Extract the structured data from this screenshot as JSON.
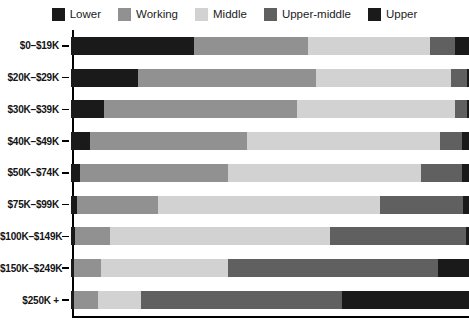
{
  "legend": {
    "position": "top",
    "items": [
      {
        "label": "Lower",
        "color": "#1a1a1a",
        "icon": "legend-swatch-icon"
      },
      {
        "label": "Working",
        "color": "#919191",
        "icon": "legend-swatch-icon"
      },
      {
        "label": "Middle",
        "color": "#d2d2d2",
        "icon": "legend-swatch-icon"
      },
      {
        "label": "Upper-middle",
        "color": "#606060",
        "icon": "legend-swatch-icon"
      },
      {
        "label": "Upper",
        "color": "#1a1a1a",
        "icon": "legend-swatch-icon"
      }
    ]
  },
  "axes": {
    "ylabel": "",
    "xlabel": "",
    "xlim": [
      0,
      100
    ],
    "grid": false,
    "ticks": "left"
  },
  "chart_data": {
    "type": "bar",
    "orientation": "horizontal",
    "stacked": true,
    "normalized": true,
    "title": "",
    "subtitle": "",
    "xlabel": "",
    "ylabel": "",
    "xlim": [
      0,
      100
    ],
    "grid": false,
    "legend_position": "top",
    "categories": [
      "$0–$19K",
      "$20K–$29K",
      "$30K–$39K",
      "$40K–$49K",
      "$50K–$74K",
      "$75K–$99K",
      "$100K–$149K",
      "$150K–$249K",
      "$250K +"
    ],
    "series": [
      {
        "name": "Lower",
        "color": "#1a1a1a",
        "values": [
          31.0,
          17.0,
          8.5,
          4.8,
          2.3,
          1.6,
          1.2,
          1.0,
          1.0
        ]
      },
      {
        "name": "Working",
        "color": "#919191",
        "values": [
          28.5,
          44.6,
          48.4,
          39.6,
          37.3,
          20.4,
          8.6,
          6.6,
          6.0
        ]
      },
      {
        "name": "Middle",
        "color": "#d2d2d2",
        "values": [
          30.7,
          34.0,
          39.6,
          48.4,
          48.4,
          55.7,
          55.4,
          32.0,
          10.8
        ]
      },
      {
        "name": "Upper-middle",
        "color": "#606060",
        "values": [
          6.3,
          3.8,
          3.0,
          5.5,
          10.3,
          20.7,
          34.0,
          52.6,
          50.4
        ]
      },
      {
        "name": "Upper",
        "color": "#1a1a1a",
        "values": [
          3.5,
          0.6,
          0.5,
          1.7,
          1.7,
          1.6,
          0.8,
          7.8,
          31.8
        ]
      }
    ]
  }
}
